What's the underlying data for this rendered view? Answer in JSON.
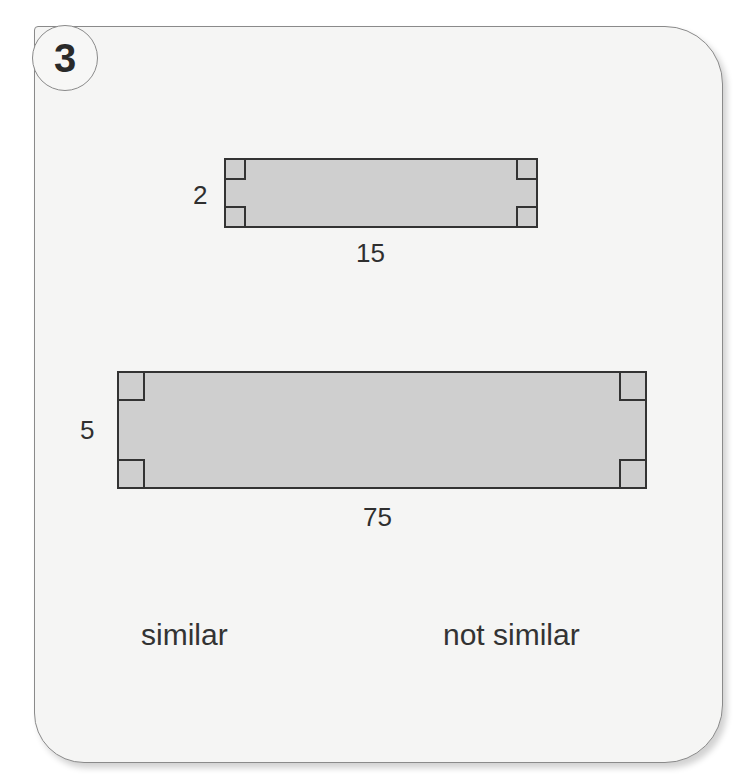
{
  "problem": {
    "number": "3"
  },
  "figures": [
    {
      "name": "small-rectangle",
      "height_label": "2",
      "width_label": "15",
      "right_angles": 4
    },
    {
      "name": "large-rectangle",
      "height_label": "5",
      "width_label": "75",
      "right_angles": 4
    }
  ],
  "choices": [
    {
      "label": "similar"
    },
    {
      "label": "not similar"
    }
  ],
  "colors": {
    "fill": "#cfcfcf",
    "stroke": "#333333",
    "card": "#f5f5f4"
  }
}
